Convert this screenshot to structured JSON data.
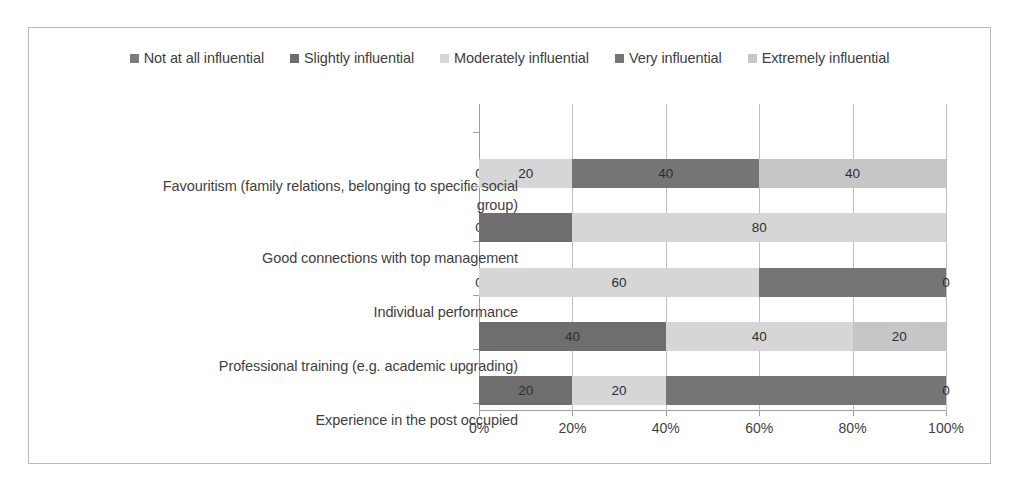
{
  "chart_data": {
    "type": "bar",
    "subtype": "horizontal-100-percent-stacked",
    "title": "",
    "xlabel": "",
    "ylabel": "",
    "xlim": [
      0,
      100
    ],
    "xticks": [
      "0%",
      "20%",
      "40%",
      "60%",
      "80%",
      "100%"
    ],
    "xtick_values": [
      0,
      20,
      40,
      60,
      80,
      100
    ],
    "grid": true,
    "legend_position": "top",
    "categories": [
      "Favouritism (family relations, belonging to specific social group)",
      "Good connections with top management",
      "Individual performance",
      "Professional training (e.g. academic upgrading)",
      "Experience in the post occupied"
    ],
    "series": [
      {
        "name": "Not at all influential",
        "color": "#7c7c7c",
        "values": [
          0,
          0,
          0,
          0,
          0
        ]
      },
      {
        "name": "Slightly influential",
        "color": "#6e6e6e",
        "values": [
          0,
          20,
          0,
          40,
          20
        ]
      },
      {
        "name": "Moderately influential",
        "color": "#d6d6d6",
        "values": [
          20,
          80,
          60,
          40,
          20
        ]
      },
      {
        "name": "Very influential",
        "color": "#757575",
        "values": [
          40,
          0,
          40,
          0,
          60
        ]
      },
      {
        "name": "Extremely influential",
        "color": "#c6c6c6",
        "values": [
          40,
          0,
          0,
          20,
          0
        ]
      }
    ],
    "data_labels": [
      [
        "0",
        "20",
        "40",
        "40"
      ],
      [
        "0",
        "80"
      ],
      [
        "0",
        "60",
        "0"
      ],
      [
        "40",
        "40",
        "20"
      ],
      [
        "20",
        "20",
        "0"
      ]
    ]
  },
  "legend": {
    "items": [
      {
        "label": "Not at all influential",
        "color": "#7c7c7c"
      },
      {
        "label": "Slightly influential",
        "color": "#6e6e6e"
      },
      {
        "label": "Moderately influential",
        "color": "#d6d6d6"
      },
      {
        "label": "Very influential",
        "color": "#757575"
      },
      {
        "label": "Extremely influential",
        "color": "#c6c6c6"
      }
    ]
  },
  "axis": {
    "x_labels": [
      "0%",
      "20%",
      "40%",
      "60%",
      "80%",
      "100%"
    ]
  },
  "categories": {
    "c0_line1": "Favouritism (family relations, belonging to specific social",
    "c0_line2": "group)",
    "c1": "Good connections with top management",
    "c2": "Individual performance",
    "c3": "Professional training (e.g. academic upgrading)",
    "c4": "Experience in the post occupied"
  },
  "bars": [
    {
      "category": "Favouritism (family relations, belonging to specific social group)",
      "segments": [
        {
          "series": "Not at all influential",
          "value": 0,
          "label": "0",
          "color": "#7c7c7c"
        },
        {
          "series": "Moderately influential",
          "value": 20,
          "label": "20",
          "color": "#d6d6d6"
        },
        {
          "series": "Very influential",
          "value": 40,
          "label": "40",
          "color": "#757575"
        },
        {
          "series": "Extremely influential",
          "value": 40,
          "label": "40",
          "color": "#c6c6c6"
        }
      ]
    },
    {
      "category": "Good connections with top management",
      "segments": [
        {
          "series": "Not at all influential",
          "value": 0,
          "label": "0",
          "color": "#7c7c7c"
        },
        {
          "series": "Slightly influential",
          "value": 20,
          "label": "",
          "color": "#6e6e6e"
        },
        {
          "series": "Moderately influential",
          "value": 80,
          "label": "80",
          "color": "#d6d6d6"
        }
      ]
    },
    {
      "category": "Individual performance",
      "segments": [
        {
          "series": "Not at all influential",
          "value": 0,
          "label": "0",
          "color": "#7c7c7c"
        },
        {
          "series": "Moderately influential",
          "value": 60,
          "label": "60",
          "color": "#d6d6d6"
        },
        {
          "series": "Very influential",
          "value": 40,
          "label": "",
          "color": "#757575"
        },
        {
          "series": "Extremely influential",
          "value": 0,
          "label": "0",
          "color": "#c6c6c6"
        }
      ]
    },
    {
      "category": "Professional training (e.g. academic upgrading)",
      "segments": [
        {
          "series": "Slightly influential",
          "value": 40,
          "label": "40",
          "color": "#6e6e6e"
        },
        {
          "series": "Moderately influential",
          "value": 40,
          "label": "40",
          "color": "#d6d6d6"
        },
        {
          "series": "Extremely influential",
          "value": 20,
          "label": "20",
          "color": "#c6c6c6"
        }
      ]
    },
    {
      "category": "Experience in the post occupied",
      "segments": [
        {
          "series": "Slightly influential",
          "value": 20,
          "label": "20",
          "color": "#6e6e6e"
        },
        {
          "series": "Moderately influential",
          "value": 20,
          "label": "20",
          "color": "#d6d6d6"
        },
        {
          "series": "Very influential",
          "value": 60,
          "label": "",
          "color": "#757575"
        },
        {
          "series": "Extremely influential",
          "value": 0,
          "label": "0",
          "color": "#c6c6c6"
        }
      ]
    }
  ]
}
